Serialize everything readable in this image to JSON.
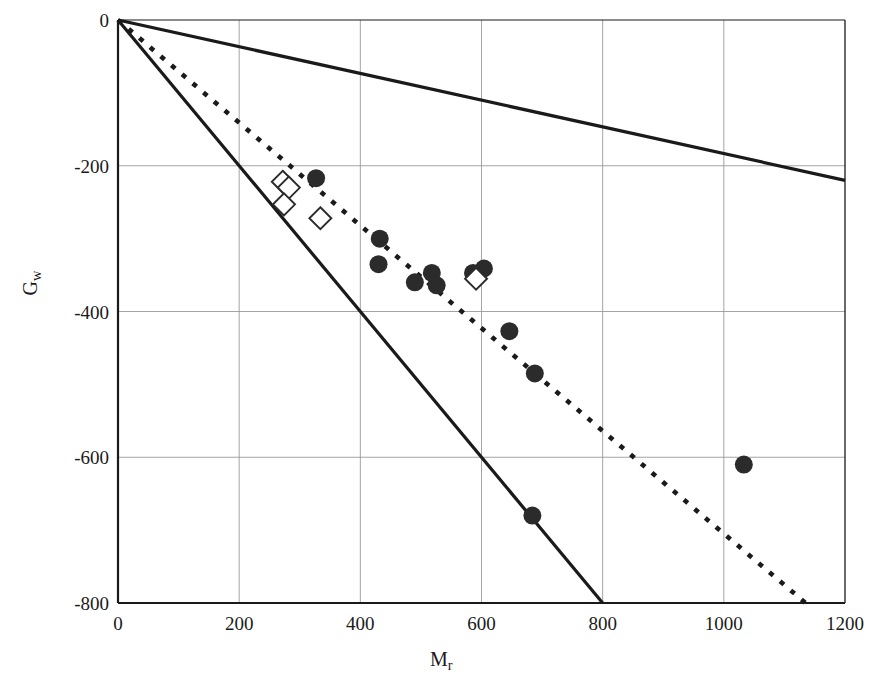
{
  "chart_data": {
    "type": "scatter",
    "title": "",
    "xlabel": "M_r",
    "ylabel": "G_w",
    "xlabel_base": "M",
    "xlabel_sub": "r",
    "ylabel_base": "G",
    "ylabel_sub": "w",
    "xlim": [
      0,
      1200
    ],
    "ylim": [
      -800,
      0
    ],
    "xticks": [
      0,
      200,
      400,
      600,
      800,
      1000,
      1200
    ],
    "yticks": [
      0,
      -200,
      -400,
      -600,
      -800
    ],
    "xticklabels": [
      "0",
      "200",
      "400",
      "600",
      "800",
      "1000",
      "1200"
    ],
    "yticklabels": [
      "0",
      "-200",
      "-400",
      "-600",
      "-800"
    ],
    "grid": true,
    "grid_color": "#9a9a9a",
    "legend": "none",
    "marker_color": "#2b2b2b",
    "line_color": "#1a1a1a",
    "series": [
      {
        "name": "filled-circles",
        "marker": "filled-circle",
        "points": [
          [
            327,
            -217
          ],
          [
            432,
            -300
          ],
          [
            430,
            -335
          ],
          [
            490,
            -360
          ],
          [
            518,
            -347
          ],
          [
            526,
            -364
          ],
          [
            586,
            -347
          ],
          [
            604,
            -341
          ],
          [
            646,
            -427
          ],
          [
            688,
            -485
          ],
          [
            1033,
            -610
          ],
          [
            684,
            -680
          ]
        ]
      },
      {
        "name": "open-diamonds",
        "marker": "open-diamond",
        "points": [
          [
            272,
            -222
          ],
          [
            282,
            -230
          ],
          [
            274,
            -253
          ],
          [
            334,
            -272
          ],
          [
            591,
            -355
          ]
        ]
      }
    ],
    "reference_lines": [
      {
        "name": "upper-solid-line",
        "style": "solid",
        "from": [
          0,
          0
        ],
        "to": [
          1200,
          -220
        ],
        "slope": -0.183
      },
      {
        "name": "middle-dotted-line",
        "style": "dotted",
        "from": [
          0,
          0
        ],
        "to": [
          1135,
          -800
        ],
        "slope": -0.705
      },
      {
        "name": "lower-solid-line",
        "style": "solid",
        "from": [
          0,
          0
        ],
        "to": [
          800,
          -800
        ],
        "slope": -1.0
      }
    ]
  }
}
